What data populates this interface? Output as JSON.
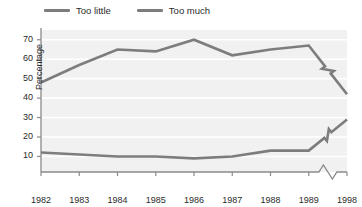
{
  "chart_data": {
    "type": "line",
    "title": "",
    "subtitle": "",
    "xlabel": "",
    "ylabel": "Percentage",
    "x": [
      "1982",
      "1983",
      "1984",
      "1985",
      "1986",
      "1987",
      "1988",
      "1989",
      "1998"
    ],
    "xtick_labels": [
      "1982",
      "1983",
      "1984",
      "1985",
      "1986",
      "1987",
      "1988",
      "1989",
      "1998"
    ],
    "ytick_labels": [
      "10",
      "20",
      "30",
      "40",
      "50",
      "60",
      "70"
    ],
    "yticks": [
      10,
      20,
      30,
      40,
      50,
      60,
      70
    ],
    "ylim": [
      2,
      75
    ],
    "grid": "horizontal-white-on-gray",
    "legend_position": "top-left",
    "axis_break": {
      "present": true,
      "between": [
        "1989",
        "1998"
      ],
      "marker": "zigzag"
    },
    "series": [
      {
        "name": "Too little",
        "color": "#7d7d7d",
        "values": [
          12,
          11,
          10,
          10,
          9,
          10,
          13,
          13,
          29
        ]
      },
      {
        "name": "Too much",
        "color": "#7d7d7d",
        "values": [
          48,
          57,
          65,
          64,
          70,
          62,
          65,
          67,
          42
        ]
      }
    ]
  },
  "legend": {
    "entries": [
      {
        "label": "Too little",
        "color": "#7d7d7d"
      },
      {
        "label": "Too much",
        "color": "#7d7d7d"
      }
    ]
  },
  "axis": {
    "y_title": "Percentage"
  }
}
